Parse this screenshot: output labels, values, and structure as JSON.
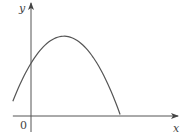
{
  "chart_data": {
    "type": "line",
    "title": "",
    "xlabel": "x",
    "ylabel": "y",
    "origin_label": "0",
    "curve": {
      "kind": "parabola",
      "opens": "down",
      "x_range": [
        -0.55,
        2.7
      ],
      "vertex": [
        1.0,
        2.8
      ],
      "y_intercept": 1.85,
      "endpoint_y": 0.65
    },
    "xlim": [
      -0.55,
      3.7
    ],
    "ylim": [
      -0.6,
      3.9
    ],
    "grid": false,
    "legend": "none"
  },
  "colors": {
    "stroke": "#555555",
    "text": "#444444"
  }
}
